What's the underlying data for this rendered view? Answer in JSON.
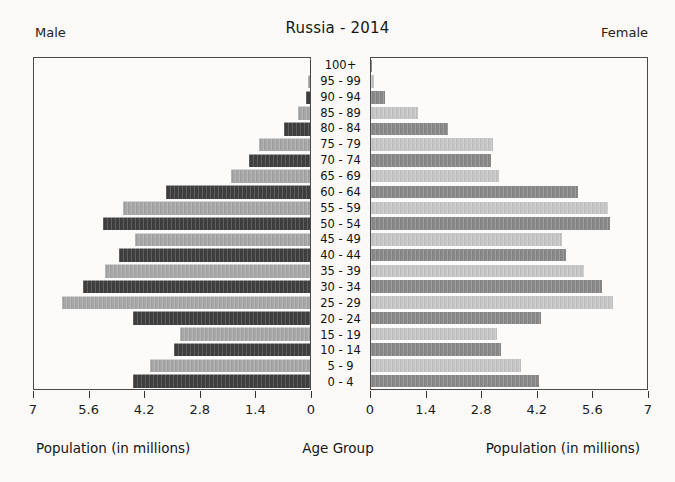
{
  "title": "Russia - 2014",
  "headers": {
    "male": "Male",
    "female": "Female"
  },
  "captions": {
    "left": "Population (in millions)",
    "center": "Age Group",
    "right": "Population (in millions)"
  },
  "colors": {
    "male_dark": "#3f3f3f",
    "male_light": "#a7a7a7",
    "female_dark": "#898989",
    "female_light": "#c6c6c6",
    "plot_border": "#4a4a4a",
    "background": "#faf9f7"
  },
  "axes": {
    "xmax": 7,
    "left_ticks": [
      "7",
      "5.6",
      "4.2",
      "2.8",
      "1.4",
      "0"
    ],
    "right_ticks": [
      "0",
      "1.4",
      "2.8",
      "4.2",
      "5.6",
      "7"
    ]
  },
  "chart_data": {
    "type": "bar",
    "subtype": "population-pyramid",
    "title": "Russia - 2014",
    "unit": "millions of people",
    "xlabel": "Population (in millions)",
    "ylabel": "Age Group",
    "xlim_each_side": [
      0,
      7
    ],
    "categories_top_to_bottom": [
      "100+",
      "95 - 99",
      "90 - 94",
      "85 - 89",
      "80 - 84",
      "75 - 79",
      "70 - 74",
      "65 - 69",
      "60 - 64",
      "55 - 59",
      "50 - 54",
      "45 - 49",
      "40 - 44",
      "35 - 39",
      "30 - 34",
      "25 - 29",
      "20 - 24",
      "15 - 19",
      "10 - 14",
      "5 - 9",
      "0 - 4"
    ],
    "series": [
      {
        "name": "Male",
        "side": "left",
        "values": [
          0.01,
          0.05,
          0.1,
          0.3,
          0.65,
          1.3,
          1.55,
          2.0,
          3.65,
          4.75,
          5.25,
          4.45,
          4.85,
          5.2,
          5.75,
          6.3,
          4.5,
          3.3,
          3.45,
          4.05,
          4.5
        ]
      },
      {
        "name": "Female",
        "side": "right",
        "values": [
          0.01,
          0.08,
          0.35,
          1.2,
          1.95,
          3.1,
          3.05,
          3.25,
          5.25,
          6.0,
          6.05,
          4.85,
          4.95,
          5.4,
          5.85,
          6.15,
          4.3,
          3.2,
          3.3,
          3.8,
          4.25
        ]
      }
    ],
    "legend": "none",
    "grid": false,
    "bar_shading_top_to_bottom": "alternating dark/light gray, even rows dark"
  }
}
